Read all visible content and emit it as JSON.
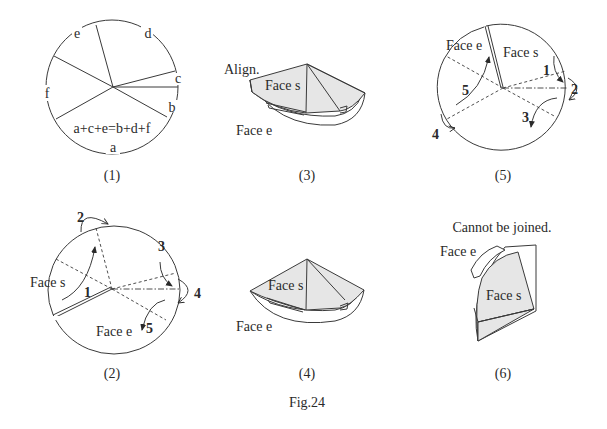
{
  "figure": {
    "title": "Fig.24",
    "panels": [
      {
        "id": "1",
        "caption": "(1)",
        "arc_labels": [
          "a",
          "b",
          "c",
          "d",
          "e",
          "f"
        ],
        "equation": "a+c+e=b+d+f"
      },
      {
        "id": "2",
        "caption": "(2)",
        "face_labels": {
          "s": "Face s",
          "e": "Face e"
        },
        "steps": [
          "1",
          "2",
          "3",
          "4",
          "5"
        ]
      },
      {
        "id": "3",
        "caption": "(3)",
        "note": "Align.",
        "face_labels": {
          "s": "Face s",
          "e": "Face e"
        }
      },
      {
        "id": "4",
        "caption": "(4)",
        "face_labels": {
          "s": "Face s",
          "e": "Face e"
        }
      },
      {
        "id": "5",
        "caption": "(5)",
        "face_labels": {
          "s": "Face s",
          "e": "Face e"
        },
        "steps": [
          "1",
          "2",
          "3",
          "4",
          "5"
        ]
      },
      {
        "id": "6",
        "caption": "(6)",
        "note": "Cannot be joined.",
        "face_labels": {
          "s": "Face s",
          "e": "Face e"
        }
      }
    ]
  },
  "colors": {
    "line": "#3a3a3a",
    "shade": "#e6e6e6",
    "background": "#ffffff"
  }
}
